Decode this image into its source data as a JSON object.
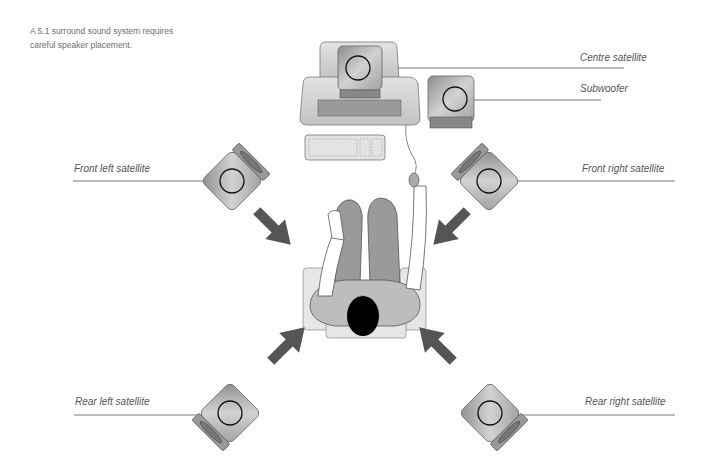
{
  "caption": "A 5.1 surround sound system requires careful speaker placement.",
  "labels": {
    "centre": "Centre satellite",
    "subwoofer": "Subwoofer",
    "front_left": "Front left satellite",
    "front_right": "Front right satellite",
    "rear_left": "Rear left satellite",
    "rear_right": "Rear right satellite"
  },
  "colors": {
    "speaker_fill": "#b8b8b8",
    "arrow": "#555555",
    "body": "#bdbdbd",
    "head": "#000000",
    "line": "#555555"
  }
}
